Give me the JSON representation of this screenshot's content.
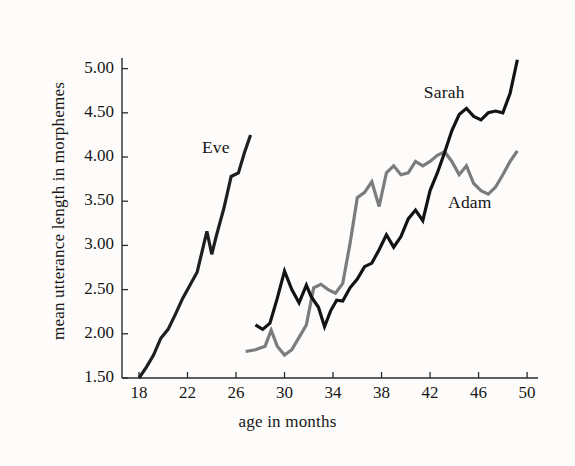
{
  "figure": {
    "background_color": "#fdfcfa",
    "axis_color": "#2b2b2b"
  },
  "chart_data": {
    "type": "line",
    "title": "",
    "subtitle": "",
    "xlabel": "age in months",
    "ylabel": "mean utterance length in morphemes",
    "xlim": [
      16.6,
      50.9
    ],
    "ylim": [
      1.5,
      5.12
    ],
    "grid": false,
    "legend_position": "inline-annotations",
    "xticks": [
      18,
      22,
      26,
      30,
      34,
      38,
      42,
      46,
      50
    ],
    "xtick_labels": [
      "18",
      "22",
      "26",
      "30",
      "34",
      "38",
      "42",
      "46",
      "50"
    ],
    "yticks": [
      1.5,
      2.0,
      2.5,
      3.0,
      3.5,
      4.0,
      4.5,
      5.0
    ],
    "ytick_labels": [
      "1.50",
      "2.00",
      "2.50",
      "3.00",
      "3.50",
      "4.00",
      "4.50",
      "5.00"
    ],
    "series": [
      {
        "name": "Eve",
        "color": "#1f1f1f",
        "label_x": 25.0,
        "label_y": 4.1,
        "x": [
          18.0,
          18.6,
          19.2,
          19.8,
          20.4,
          21.0,
          21.6,
          22.2,
          22.8,
          23.2,
          23.6,
          24.0,
          24.4,
          25.0,
          25.6,
          26.2,
          26.7,
          27.2
        ],
        "y": [
          1.5,
          1.62,
          1.76,
          1.95,
          2.05,
          2.22,
          2.4,
          2.55,
          2.7,
          2.93,
          3.16,
          2.9,
          3.12,
          3.42,
          3.78,
          3.82,
          4.05,
          4.25
        ]
      },
      {
        "name": "Adam",
        "color": "#7c7c7c",
        "label_x": 45.3,
        "label_y": 3.48,
        "x": [
          26.8,
          27.6,
          28.4,
          28.9,
          29.4,
          30.0,
          30.6,
          31.2,
          31.8,
          32.4,
          33.0,
          33.6,
          34.2,
          34.8,
          35.4,
          36.0,
          36.6,
          37.2,
          37.8,
          38.4,
          39.0,
          39.6,
          40.2,
          40.8,
          41.4,
          42.0,
          42.6,
          43.2,
          43.8,
          44.4,
          45.0,
          45.6,
          46.2,
          46.8,
          47.4,
          48.0,
          48.6,
          49.2
        ],
        "y": [
          1.8,
          1.82,
          1.86,
          2.04,
          1.86,
          1.76,
          1.82,
          1.96,
          2.1,
          2.52,
          2.56,
          2.5,
          2.46,
          2.57,
          3.02,
          3.54,
          3.6,
          3.72,
          3.44,
          3.82,
          3.9,
          3.8,
          3.82,
          3.95,
          3.9,
          3.95,
          4.02,
          4.06,
          3.95,
          3.8,
          3.9,
          3.7,
          3.62,
          3.58,
          3.66,
          3.8,
          3.95,
          4.07
        ]
      },
      {
        "name": "Sarah",
        "color": "#131313",
        "label_x": 43.3,
        "label_y": 4.72,
        "x": [
          27.6,
          28.2,
          28.8,
          29.4,
          30.0,
          30.6,
          31.2,
          31.8,
          32.2,
          32.8,
          33.3,
          33.8,
          34.3,
          34.8,
          35.4,
          36.0,
          36.6,
          37.2,
          37.8,
          38.4,
          39.0,
          39.6,
          40.2,
          40.8,
          41.4,
          42.0,
          42.6,
          43.2,
          43.8,
          44.4,
          45.0,
          45.6,
          46.2,
          46.8,
          47.4,
          48.0,
          48.6,
          49.2
        ],
        "y": [
          2.1,
          2.05,
          2.12,
          2.4,
          2.71,
          2.5,
          2.35,
          2.55,
          2.42,
          2.3,
          2.08,
          2.26,
          2.38,
          2.37,
          2.52,
          2.62,
          2.76,
          2.8,
          2.95,
          3.12,
          2.98,
          3.1,
          3.3,
          3.4,
          3.28,
          3.62,
          3.82,
          4.05,
          4.3,
          4.48,
          4.55,
          4.46,
          4.42,
          4.5,
          4.52,
          4.5,
          4.72,
          5.1
        ]
      }
    ]
  }
}
